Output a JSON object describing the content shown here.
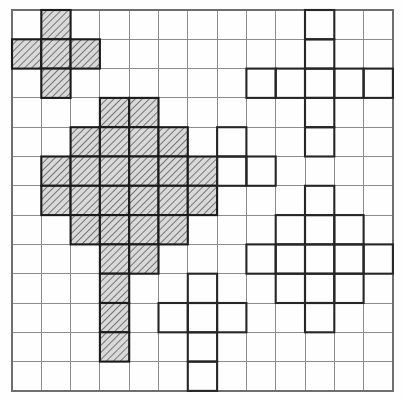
{
  "figure": {
    "title": "",
    "type": "grid-polyomino-puzzle",
    "grid": {
      "columns": 13,
      "rows": 13,
      "cell_size": 29.3,
      "origin_x": 12,
      "origin_y": 10,
      "line_color": "#8c8c8c",
      "border_color": "#6e6e6e",
      "background": "#ffffff"
    },
    "styles": {
      "hatched_fill": "#d9d9d9",
      "hatched_stroke": "#1b1b1b",
      "hatch_line_color": "#5a5a5a",
      "outline_stroke": "#262626",
      "outline_fill": "none"
    },
    "shapes": [
      {
        "name": "hatched-plus-top-left",
        "style": "hatched",
        "cells": [
          [
            1,
            2
          ],
          [
            2,
            1
          ],
          [
            2,
            2
          ],
          [
            2,
            3
          ],
          [
            3,
            2
          ]
        ],
        "cell_count": 5
      },
      {
        "name": "hatched-large-diamond",
        "style": "hatched",
        "cells": [
          [
            4,
            4
          ],
          [
            4,
            5
          ],
          [
            5,
            3
          ],
          [
            5,
            4
          ],
          [
            5,
            5
          ],
          [
            5,
            6
          ],
          [
            6,
            2
          ],
          [
            6,
            3
          ],
          [
            6,
            4
          ],
          [
            6,
            5
          ],
          [
            6,
            6
          ],
          [
            6,
            7
          ],
          [
            7,
            2
          ],
          [
            7,
            3
          ],
          [
            7,
            4
          ],
          [
            7,
            5
          ],
          [
            7,
            6
          ],
          [
            7,
            7
          ],
          [
            8,
            3
          ],
          [
            8,
            4
          ],
          [
            8,
            5
          ],
          [
            8,
            6
          ],
          [
            9,
            4
          ],
          [
            9,
            5
          ]
        ],
        "cell_count": 24
      },
      {
        "name": "hatched-vertical-strip",
        "style": "hatched",
        "cells": [
          [
            10,
            4
          ],
          [
            11,
            4
          ],
          [
            12,
            4
          ]
        ],
        "cell_count": 3
      },
      {
        "name": "outline-large-cross-top-right",
        "style": "outline",
        "cells": [
          [
            1,
            11
          ],
          [
            2,
            11
          ],
          [
            3,
            9
          ],
          [
            3,
            10
          ],
          [
            3,
            11
          ],
          [
            3,
            12
          ],
          [
            3,
            13
          ],
          [
            4,
            11
          ],
          [
            5,
            11
          ]
        ],
        "cell_count": 9
      },
      {
        "name": "outline-l-tromino",
        "style": "outline",
        "cells": [
          [
            5,
            8
          ],
          [
            6,
            8
          ],
          [
            6,
            9
          ]
        ],
        "cell_count": 3
      },
      {
        "name": "outline-diamond-bottom-right",
        "style": "outline",
        "cells": [
          [
            7,
            11
          ],
          [
            8,
            10
          ],
          [
            8,
            11
          ],
          [
            8,
            12
          ],
          [
            9,
            9
          ],
          [
            9,
            10
          ],
          [
            9,
            11
          ],
          [
            9,
            12
          ],
          [
            9,
            13
          ],
          [
            10,
            10
          ],
          [
            10,
            11
          ],
          [
            10,
            12
          ],
          [
            11,
            11
          ]
        ],
        "cell_count": 13
      },
      {
        "name": "outline-cross-bottom-middle",
        "style": "outline",
        "cells": [
          [
            10,
            7
          ],
          [
            11,
            6
          ],
          [
            11,
            7
          ],
          [
            11,
            8
          ],
          [
            12,
            7
          ],
          [
            13,
            7
          ]
        ],
        "cell_count": 6
      }
    ],
    "legend": {
      "hatched_label": "",
      "outline_label": ""
    }
  }
}
